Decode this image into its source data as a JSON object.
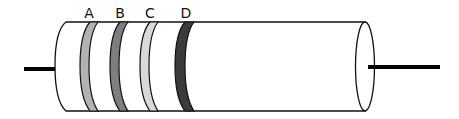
{
  "diagram": {
    "type": "resistor-color-bands",
    "bands": [
      {
        "label": "A",
        "color": "#b2b2b2"
      },
      {
        "label": "B",
        "color": "#7e7e7e"
      },
      {
        "label": "C",
        "color": "#d9d9d9"
      },
      {
        "label": "D",
        "color": "#3b3b3b"
      }
    ],
    "body_color": "#ffffff",
    "outline_color": "#111111",
    "lead_color": "#000000"
  }
}
